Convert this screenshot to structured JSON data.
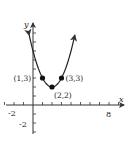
{
  "chart_data": {
    "type": "line",
    "title": "",
    "function": "y = (x - 2)^2 + 2",
    "xlabel": "x",
    "ylabel": "y",
    "xlim": [
      -2,
      9
    ],
    "ylim": [
      -3,
      9
    ],
    "grid": false,
    "x_tick_labels": [
      "-2",
      "8"
    ],
    "y_tick_labels": [
      "-2"
    ],
    "series": [
      {
        "name": "parabola",
        "x": [
          -0.4,
          0,
          1,
          2,
          3,
          4,
          4.4
        ],
        "y": [
          7.76,
          6,
          3,
          2,
          3,
          6,
          7.76
        ]
      }
    ],
    "points": [
      {
        "x": 1,
        "y": 3,
        "label": "(1, 3)"
      },
      {
        "x": 2,
        "y": 2,
        "label": "(2, 2)"
      },
      {
        "x": 3,
        "y": 3,
        "label": "(3, 3)"
      }
    ],
    "colors": {
      "curve": "#222222",
      "axes": "#333333",
      "points": "#111111"
    }
  }
}
